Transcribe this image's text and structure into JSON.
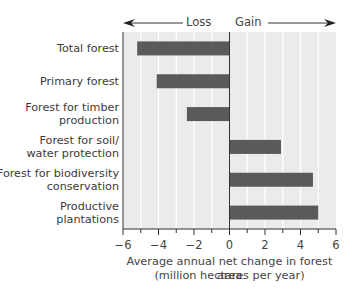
{
  "chart_data": {
    "type": "bar",
    "orientation": "horizontal",
    "title": "",
    "categories": [
      "Total forest",
      "Primary forest",
      "Forest for timber production",
      "Forest for soil/ water protection",
      "Forest for biodiversity conservation",
      "Productive plantations"
    ],
    "category_lines": [
      [
        "Total forest"
      ],
      [
        "Primary forest"
      ],
      [
        "Forest for timber",
        "production"
      ],
      [
        "Forest for soil/",
        "water protection"
      ],
      [
        "Forest for biodiversity",
        "conservation"
      ],
      [
        "Productive",
        "plantations"
      ]
    ],
    "values": [
      -5.2,
      -4.1,
      -2.4,
      2.9,
      4.7,
      5.0
    ],
    "xlabel": "Average annual net change in forest area",
    "xlabel_line2": "(million hectares per year)",
    "ylabel": "",
    "xlim": [
      -6,
      6
    ],
    "xticks": [
      -6,
      -4,
      -2,
      0,
      2,
      4,
      6
    ],
    "xtick_labels": [
      "−6",
      "−4",
      "−2",
      "0",
      "2",
      "4",
      "6"
    ],
    "minor_ticks_step": 1,
    "grid": true,
    "annotations": {
      "left_arrow": "Loss",
      "right_arrow": "Gain"
    },
    "colors": {
      "bar": "#5a5a5a",
      "plot_bg": "#ebebeb",
      "grid": "#ffffff",
      "axis": "#333333"
    }
  }
}
